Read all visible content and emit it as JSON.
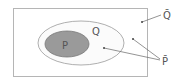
{
  "diagram": {
    "type": "venn",
    "universe_complement_label": "Q̄",
    "outer_set_label": "Q",
    "inner_set_label": "P",
    "complement_p_label": "P̄",
    "colors": {
      "border": "#b5b5b5",
      "inner_fill": "#9a9a9a",
      "outer_fill": "#fbfbfb",
      "text": "#555555",
      "line": "#666666"
    }
  }
}
